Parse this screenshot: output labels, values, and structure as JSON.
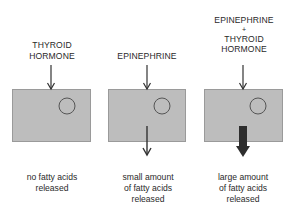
{
  "panels": [
    {
      "input_label": [
        "THYROID",
        "HORMONE"
      ],
      "output_caption": [
        "no fatty acids",
        "released"
      ],
      "output_arrow": "none"
    },
    {
      "input_label": [
        "EPINEPHRINE"
      ],
      "output_caption": [
        "small amount",
        "of fatty acids",
        "released"
      ],
      "output_arrow": "thin"
    },
    {
      "input_label": [
        "EPINEPHRINE",
        "+",
        "THYROID",
        "HORMONE"
      ],
      "output_caption": [
        "large amount",
        "of fatty acids",
        "released"
      ],
      "output_arrow": "thick"
    }
  ],
  "colors": {
    "cell_fill": "#bdbdbd",
    "arrow": "#333333",
    "text": "#2a2a2a"
  }
}
